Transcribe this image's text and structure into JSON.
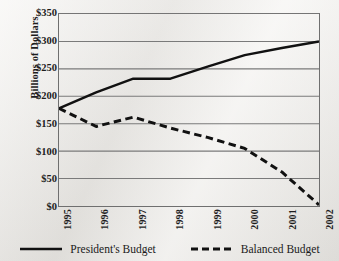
{
  "chart_data": {
    "type": "line",
    "title": "",
    "xlabel": "",
    "ylabel": "Billions of Dollars",
    "x": [
      1995,
      1996,
      1997,
      1998,
      1999,
      2000,
      2001,
      2002
    ],
    "categories": [
      "1995",
      "1996",
      "1997",
      "1998",
      "1999",
      "2000",
      "2001",
      "2002"
    ],
    "series": [
      {
        "name": "President's Budget",
        "style": "solid",
        "color": "#111111",
        "values": [
          178,
          207,
          232,
          232,
          254,
          275,
          288,
          300
        ]
      },
      {
        "name": "Balanced Budget",
        "style": "dashed",
        "color": "#111111",
        "values": [
          178,
          145,
          162,
          142,
          125,
          105,
          62,
          2
        ]
      }
    ],
    "ylim": [
      0,
      350
    ],
    "ytick_values": [
      0,
      50,
      100,
      150,
      200,
      250,
      300,
      350
    ],
    "ytick_labels": [
      "$0",
      "$50",
      "$100",
      "$150",
      "$200",
      "$250",
      "$300",
      "$350"
    ],
    "grid": "horizontal",
    "legend_position": "bottom-center"
  },
  "legend": {
    "items": [
      {
        "label": "President's Budget",
        "icon": "solid-line-swatch"
      },
      {
        "label": "Balanced Budget",
        "icon": "dashed-line-swatch"
      }
    ]
  },
  "colors": {
    "paper": "#eeece8",
    "ink": "#111111",
    "gridline": "#7a7a7a",
    "axis": "#6f6f6f"
  }
}
